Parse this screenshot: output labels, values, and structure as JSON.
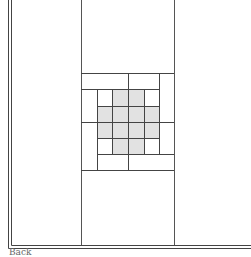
{
  "diagram": {
    "type": "quilt-layout",
    "caption": "Back",
    "colors": {
      "line": "#444444",
      "fill_shaded": "#e2e2e2",
      "background": "#ffffff"
    },
    "panels": [
      "left-panel",
      "center-panel",
      "right-panel"
    ],
    "center_block": "woven-cross-block"
  }
}
